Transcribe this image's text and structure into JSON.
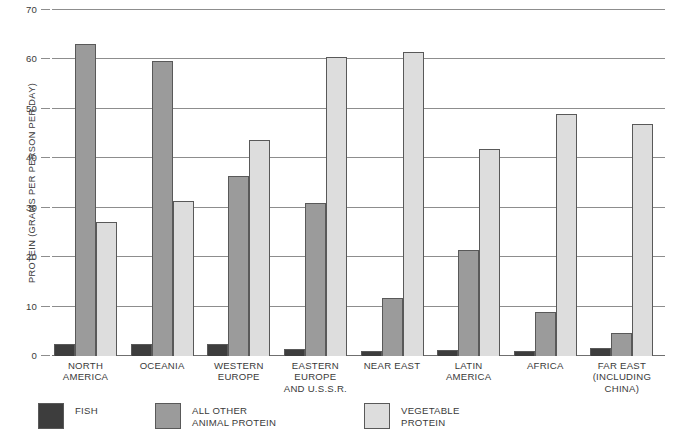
{
  "chart_data": {
    "type": "bar",
    "title": "",
    "xlabel": "",
    "ylabel": "PROTEIN (GRAMS PER PERSON PER DAY)",
    "ylim": [
      0,
      70
    ],
    "yticks": [
      0,
      10,
      20,
      30,
      40,
      50,
      60,
      70
    ],
    "ytick_labels": [
      "0",
      "10",
      "20",
      "30",
      "40",
      "50",
      "60",
      "70"
    ],
    "grid": true,
    "legend_position": "bottom-left",
    "categories": [
      "NORTH\nAMERICA",
      "OCEANIA",
      "WESTERN\nEUROPE",
      "EASTERN\nEUROPE\nAND U.S.S.R.",
      "NEAR EAST",
      "LATIN\nAMERICA",
      "AFRICA",
      "FAR EAST\n(INCLUDING\nCHINA)"
    ],
    "series": [
      {
        "name": "FISH",
        "color": "#3d3d3d",
        "values": [
          2.5,
          2.5,
          2.5,
          1.5,
          1.0,
          1.2,
          1.0,
          1.6
        ]
      },
      {
        "name": "ALL OTHER\nANIMAL PROTEIN",
        "color": "#9b9b9b",
        "values": [
          63.2,
          59.7,
          36.5,
          31.0,
          11.8,
          21.5,
          9.0,
          4.6
        ]
      },
      {
        "name": "VEGETABLE\nPROTEIN",
        "color": "#dddddd",
        "values": [
          27.2,
          31.3,
          43.7,
          60.5,
          61.5,
          41.9,
          48.9,
          46.9
        ]
      }
    ]
  }
}
